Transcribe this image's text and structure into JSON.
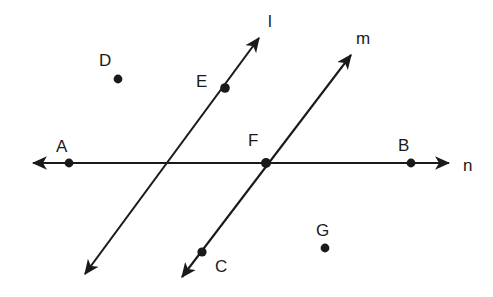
{
  "figure": {
    "background_color": "#ffffff",
    "ink_color": "#1a1a1a",
    "width": 493,
    "height": 297
  },
  "lines": [
    {
      "id": "l",
      "label": "l",
      "label_x": 268,
      "label_y": 27,
      "description": "line l, rising left-to-right, passes through point E and crosses line n",
      "x1": 85,
      "y1": 274,
      "x2": 259,
      "y2": 38,
      "arrow_start": true,
      "arrow_end": true
    },
    {
      "id": "m",
      "label": "m",
      "label_x": 356,
      "label_y": 44,
      "description": "line m, rising left-to-right, passes through point C and point F",
      "x1": 182,
      "y1": 277,
      "x2": 351,
      "y2": 55,
      "arrow_start": true,
      "arrow_end": true
    },
    {
      "id": "n",
      "label": "n",
      "label_x": 463,
      "label_y": 171,
      "description": "line n, horizontal, passes through points A, F and B",
      "x1": 33,
      "y1": 163,
      "x2": 449,
      "y2": 163,
      "arrow_start": true,
      "arrow_end": true
    }
  ],
  "points": [
    {
      "id": "A",
      "label": "A",
      "x": 69,
      "y": 163,
      "label_x": 56,
      "label_y": 152,
      "on_lines": "n",
      "marked": true
    },
    {
      "id": "B",
      "label": "B",
      "x": 411,
      "y": 163,
      "label_x": 398,
      "label_y": 151,
      "on_lines": "n",
      "marked": true
    },
    {
      "id": "C",
      "label": "C",
      "x": 202,
      "y": 252,
      "label_x": 215,
      "label_y": 272,
      "on_lines": "m",
      "marked": true
    },
    {
      "id": "D",
      "label": "D",
      "x": 118,
      "y": 79,
      "label_x": 99,
      "label_y": 66,
      "on_lines": "",
      "marked": true
    },
    {
      "id": "E",
      "label": "E",
      "x": 225,
      "y": 88,
      "label_x": 196,
      "label_y": 87,
      "on_lines": "l",
      "marked": true
    },
    {
      "id": "F",
      "label": "F",
      "x": 266,
      "y": 163,
      "label_x": 248,
      "label_y": 146,
      "on_lines": "m,n",
      "marked": true
    },
    {
      "id": "G",
      "label": "G",
      "x": 325,
      "y": 248,
      "label_x": 316,
      "label_y": 236,
      "on_lines": "",
      "marked": true
    }
  ]
}
